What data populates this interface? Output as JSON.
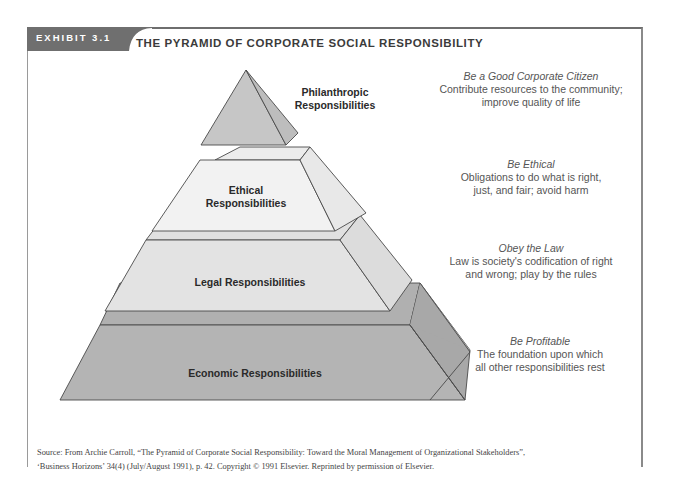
{
  "exhibit": {
    "tab_label": "EXHIBIT 3.1",
    "title": "THE PYRAMID OF CORPORATE SOCIAL RESPONSIBILITY"
  },
  "pyramid": {
    "layers": [
      {
        "id": "philanthropic",
        "label_line1": "Philanthropic",
        "label_line2": "Responsibilities",
        "desc_heading": "Be a Good Corporate Citizen",
        "desc_line1": "Contribute resources to the community;",
        "desc_line2": "improve quality of life",
        "fill": "#c8c8c8"
      },
      {
        "id": "ethical",
        "label_line1": "Ethical",
        "label_line2": "Responsibilities",
        "desc_heading": "Be Ethical",
        "desc_line1": "Obligations to do what is right,",
        "desc_line2": "just, and fair; avoid harm",
        "fill": "#f0f0f0"
      },
      {
        "id": "legal",
        "label_line1": "Legal Responsibilities",
        "desc_heading": "Obey the Law",
        "desc_line1": "Law is society's codification of right",
        "desc_line2": "and wrong; play by the rules",
        "fill": "#e2e2e2"
      },
      {
        "id": "economic",
        "label_line1": "Economic Responsibilities",
        "desc_heading": "Be Profitable",
        "desc_line1": "The foundation upon which",
        "desc_line2": "all other responsibilities rest",
        "fill": "#b4b4b4"
      }
    ]
  },
  "source": {
    "line1": "Source: From Archie Carroll, “The Pyramid of Corporate Social Responsibility: Toward the Moral Management of Organizational Stakeholders”,",
    "line2": "‘Business Horizons’ 34(4) (July/August 1991), p. 42. Copyright © 1991 Elsevier. Reprinted by permission of Elsevier."
  }
}
